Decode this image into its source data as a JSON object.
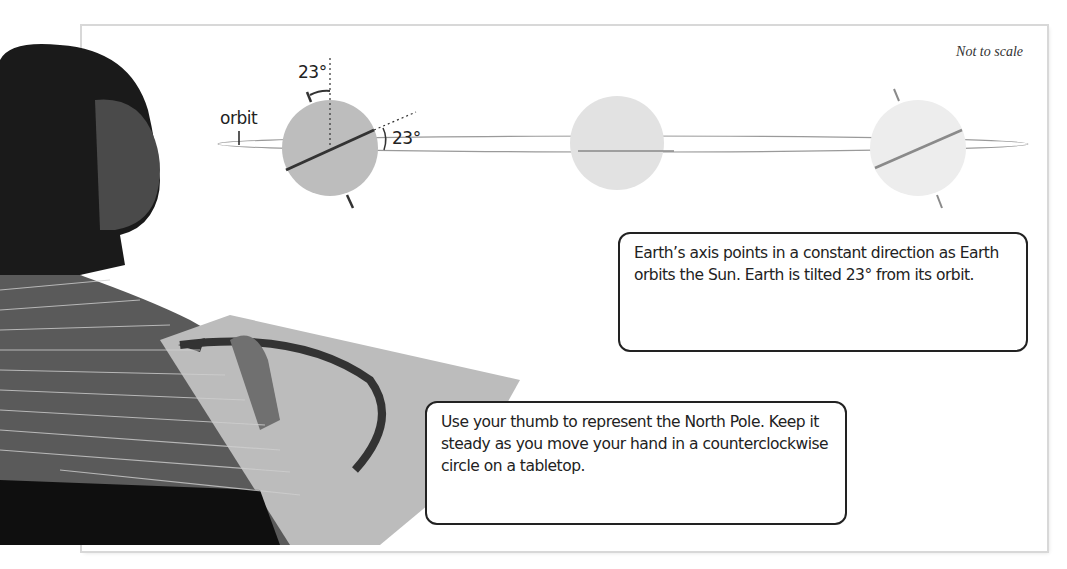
{
  "figure": {
    "scale_note": "Not to scale",
    "labels": {
      "orbit": "orbit",
      "tilt_angle_top": "23°",
      "tilt_angle_side": "23°"
    },
    "earth_positions": [
      {
        "name": "left",
        "shade": "#bdbdbd",
        "axis_color": "#333333",
        "cx": 330,
        "cy": 148,
        "r": 48
      },
      {
        "name": "middle",
        "shade": "#e2e2e2",
        "axis_color": null,
        "cx": 617,
        "cy": 143,
        "r": 47
      },
      {
        "name": "right",
        "shade": "#ededed",
        "axis_color": "#8a8a8a",
        "cx": 918,
        "cy": 148,
        "r": 48
      }
    ],
    "callouts": [
      {
        "id": "axis-direction",
        "text": "Earth’s axis points in a constant direction as Earth orbits the Sun. Earth is tilted 23° from its orbit."
      },
      {
        "id": "thumb-instructions",
        "text": "Use your thumb to represent the North Pole. Keep it steady as you move your hand in a counterclockwise circle on a tabletop."
      }
    ],
    "photo": {
      "description": "Student with thumb up moving hand in counterclockwise circle on tabletop",
      "arrow_direction": "counterclockwise"
    }
  }
}
